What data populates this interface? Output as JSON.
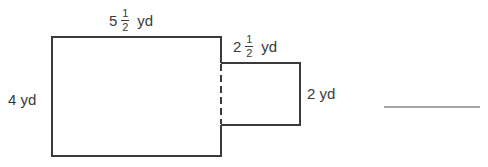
{
  "figure": {
    "type": "composite-rectangle-area",
    "large_rectangle": {
      "width_label": {
        "whole": "5",
        "numerator": "1",
        "denominator": "2",
        "unit": "yd"
      },
      "height_label": "4 yd"
    },
    "small_rectangle": {
      "width_label": {
        "whole": "2",
        "numerator": "1",
        "denominator": "2",
        "unit": "yd"
      },
      "height_label": "2 yd"
    },
    "answer_blank": ""
  },
  "colors": {
    "stroke": "#3a3a3a",
    "text": "#3a3a3a",
    "answer_line": "#888888"
  }
}
